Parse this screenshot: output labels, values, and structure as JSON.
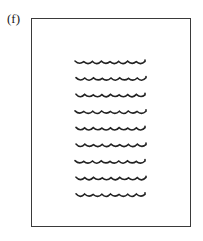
{
  "figure": {
    "label": "(f)",
    "line_count": 9,
    "line_color": "#222222"
  }
}
